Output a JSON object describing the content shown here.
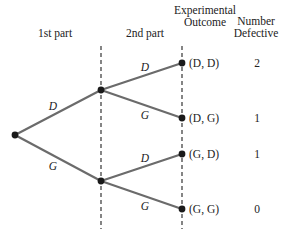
{
  "headers": {
    "first_part": "1st part",
    "second_part": "2nd part",
    "outcome_line1": "Experimental",
    "outcome_line2": "Outcome",
    "defective_line1": "Number",
    "defective_line2": "Defective"
  },
  "first_stage": {
    "upper_label": "D",
    "lower_label": "G"
  },
  "second_stage": {
    "upper_node": {
      "upper_label": "D",
      "lower_label": "G"
    },
    "lower_node": {
      "upper_label": "D",
      "lower_label": "G"
    }
  },
  "outcomes": [
    {
      "outcome": "(D, D)",
      "defective": "2"
    },
    {
      "outcome": "(D, G)",
      "defective": "1"
    },
    {
      "outcome": "(G, D)",
      "defective": "1"
    },
    {
      "outcome": "(G, G)",
      "defective": "0"
    }
  ],
  "colors": {
    "branch": "#6b6b6b",
    "node": "#1a1a1a",
    "text": "#222222"
  }
}
